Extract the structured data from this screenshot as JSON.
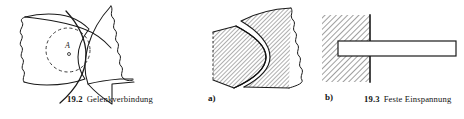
{
  "sheet": {
    "background_color": "#ffffff",
    "ink_color": "#1a1a1a",
    "width": 464,
    "height": 119
  },
  "figures": [
    {
      "id": "fig-19-2",
      "number": "19.2",
      "title": "Gelenkverbindung",
      "point_label": "A",
      "description": "Gelenkverbindung zweier Bauteile mit gestricheltem Gelenkkreis und Gelenkpunkt A"
    },
    {
      "id": "fig-19-3",
      "number": "19.3",
      "title": "Feste Einspannung",
      "sub_labels": [
        {
          "id": "sub-a",
          "label": "a)"
        },
        {
          "id": "sub-b",
          "label": "b)"
        }
      ],
      "description": "Feste Einspannung: a) formschluessige Verzahnung mit Schraffur, b) in Wand eingespannter Balken"
    }
  ],
  "caption_19_2": {
    "number": "19.2",
    "text": "Gelenkverbindung"
  },
  "caption_19_3": {
    "number": "19.3",
    "text": "Feste Einspannung"
  },
  "sublabel_a": "a)",
  "sublabel_b": "b)",
  "annotations": {
    "joint_point_label": "A"
  },
  "colors": {
    "ink": "#1a1a1a",
    "hatch": "#2b2b2b",
    "paper": "#ffffff",
    "dashed": "#333333"
  }
}
